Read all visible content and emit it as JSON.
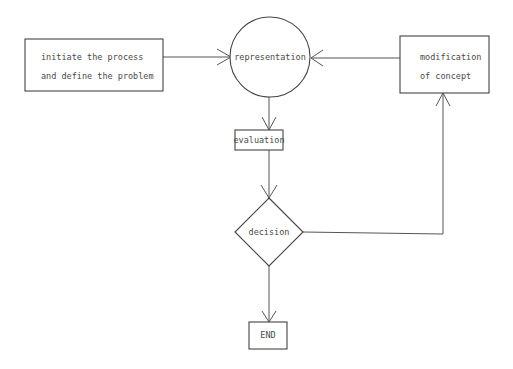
{
  "diagram": {
    "type": "flowchart",
    "nodes": [
      {
        "id": "start",
        "shape": "rectangle",
        "lines": [
          "initiate the process",
          "and define the problem"
        ]
      },
      {
        "id": "representation",
        "shape": "circle",
        "label": "representation"
      },
      {
        "id": "modification",
        "shape": "rectangle",
        "lines": [
          "modification",
          "of concept"
        ]
      },
      {
        "id": "evaluation",
        "shape": "rectangle",
        "label": "evaluation"
      },
      {
        "id": "decision",
        "shape": "diamond",
        "label": "decision"
      },
      {
        "id": "end",
        "shape": "rectangle",
        "label": "END"
      }
    ],
    "edges": [
      {
        "from": "start",
        "to": "representation"
      },
      {
        "from": "modification",
        "to": "representation"
      },
      {
        "from": "representation",
        "to": "evaluation"
      },
      {
        "from": "evaluation",
        "to": "decision"
      },
      {
        "from": "decision",
        "to": "modification"
      },
      {
        "from": "decision",
        "to": "end"
      }
    ]
  }
}
